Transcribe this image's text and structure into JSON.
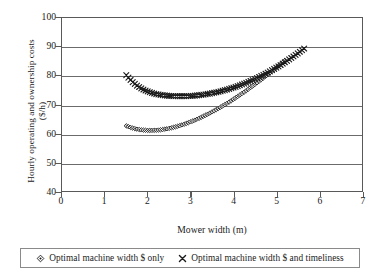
{
  "chart_data": {
    "type": "scatter",
    "title": "",
    "xlabel": "Mower width (m)",
    "ylabel": "Hourly operating and ownership costs",
    "ylabel_line2": "($/h)",
    "xlim": [
      0,
      7
    ],
    "ylim": [
      40,
      100
    ],
    "xticks": [
      0,
      1,
      2,
      3,
      4,
      5,
      6,
      7
    ],
    "yticks": [
      40,
      50,
      60,
      70,
      80,
      90,
      100
    ],
    "grid": "horizontal",
    "legend_position": "below",
    "series": [
      {
        "name": "Optimal machine width $ only",
        "marker": "diamond",
        "x": [
          1.5,
          1.55,
          1.6,
          1.65,
          1.7,
          1.75,
          1.8,
          1.85,
          1.9,
          1.95,
          2.0,
          2.05,
          2.1,
          2.15,
          2.2,
          2.25,
          2.3,
          2.35,
          2.4,
          2.45,
          2.5,
          2.55,
          2.6,
          2.65,
          2.7,
          2.75,
          2.8,
          2.85,
          2.9,
          2.95,
          3.0,
          3.05,
          3.1,
          3.15,
          3.2,
          3.25,
          3.3,
          3.35,
          3.4,
          3.45,
          3.5,
          3.55,
          3.6,
          3.65,
          3.7,
          3.75,
          3.8,
          3.85,
          3.9,
          3.95,
          4.0,
          4.05,
          4.1,
          4.15,
          4.2,
          4.25,
          4.3,
          4.35,
          4.4,
          4.45,
          4.5,
          4.55,
          4.6,
          4.65,
          4.7,
          4.75,
          4.8,
          4.85,
          4.9,
          4.95,
          5.0,
          5.05,
          5.1,
          5.15,
          5.2,
          5.25,
          5.3,
          5.35,
          5.4,
          5.45,
          5.5,
          5.55,
          5.6,
          5.65,
          5.7,
          5.75,
          5.8,
          5.85,
          5.9,
          5.95,
          6.0,
          6.05
        ],
        "y": [
          62.6,
          62.3,
          62.05,
          61.82,
          61.62,
          61.45,
          61.32,
          61.2,
          61.12,
          61.06,
          61.02,
          61.0,
          61.01,
          61.04,
          61.08,
          61.15,
          61.23,
          61.33,
          61.45,
          61.58,
          61.73,
          61.89,
          62.07,
          62.26,
          62.47,
          62.69,
          62.92,
          63.17,
          63.43,
          63.7,
          63.98,
          64.28,
          64.58,
          64.9,
          65.23,
          65.57,
          65.92,
          66.28,
          66.65,
          67.03,
          67.42,
          67.82,
          68.23,
          68.65,
          69.07,
          69.51,
          69.95,
          70.4,
          70.86,
          71.33,
          71.81,
          72.29,
          72.78,
          73.28,
          73.79,
          74.3,
          74.82,
          75.35,
          75.88,
          76.42,
          76.97,
          77.52,
          78.08,
          78.65,
          79.22,
          79.8,
          80.38,
          80.97,
          81.57,
          82.17,
          82.78,
          83.39,
          84.01,
          84.63,
          85.26,
          85.89,
          86.53,
          87.17,
          87.82,
          88.47,
          89.13,
          89.79,
          90.46,
          91.13,
          91.8,
          92.48,
          93.17,
          93.86,
          94.55,
          95.25,
          95.95,
          96.65
        ],
        "y_visible_end": 85.5
      },
      {
        "name": "Optimal machine width $ and timeliness",
        "marker": "cross",
        "x": [
          1.5,
          1.55,
          1.6,
          1.65,
          1.7,
          1.75,
          1.8,
          1.85,
          1.9,
          1.95,
          2.0,
          2.05,
          2.1,
          2.15,
          2.2,
          2.25,
          2.3,
          2.35,
          2.4,
          2.45,
          2.5,
          2.55,
          2.6,
          2.65,
          2.7,
          2.75,
          2.8,
          2.85,
          2.9,
          2.95,
          3.0,
          3.05,
          3.1,
          3.15,
          3.2,
          3.25,
          3.3,
          3.35,
          3.4,
          3.45,
          3.5,
          3.55,
          3.6,
          3.65,
          3.7,
          3.75,
          3.8,
          3.85,
          3.9,
          3.95,
          4.0,
          4.05,
          4.1,
          4.15,
          4.2,
          4.25,
          4.3,
          4.35,
          4.4,
          4.45,
          4.5,
          4.55,
          4.6,
          4.65,
          4.7,
          4.75,
          4.8,
          4.85,
          4.9,
          4.95,
          5.0,
          5.05,
          5.1,
          5.15,
          5.2,
          5.25,
          5.3,
          5.35,
          5.4,
          5.45,
          5.5,
          5.55,
          5.6,
          5.65,
          5.7,
          5.75,
          5.8,
          5.85,
          5.9,
          5.95,
          6.0,
          6.05
        ],
        "y": [
          80.2,
          79.3,
          78.5,
          77.78,
          77.14,
          76.57,
          76.06,
          75.6,
          75.2,
          74.84,
          74.53,
          74.25,
          74.01,
          73.8,
          73.62,
          73.47,
          73.34,
          73.23,
          73.14,
          73.07,
          73.01,
          72.96,
          72.93,
          72.9,
          72.89,
          72.88,
          72.88,
          72.89,
          72.91,
          72.94,
          72.98,
          73.03,
          73.09,
          73.16,
          73.24,
          73.33,
          73.43,
          73.54,
          73.66,
          73.79,
          73.93,
          74.08,
          74.24,
          74.41,
          74.59,
          74.78,
          74.98,
          75.19,
          75.41,
          75.64,
          75.88,
          76.13,
          76.39,
          76.66,
          76.94,
          77.23,
          77.53,
          77.84,
          78.16,
          78.49,
          78.83,
          79.18,
          79.54,
          79.91,
          80.29,
          80.68,
          81.08,
          81.49,
          81.91,
          82.34,
          82.78,
          83.23,
          83.69,
          84.16,
          84.64,
          85.13,
          85.63,
          86.14,
          86.66,
          87.19,
          87.73,
          88.28,
          88.84,
          89.41,
          89.99,
          90.58,
          91.18,
          91.79,
          92.41,
          93.04,
          93.68,
          94.33
        ],
        "y_visible_end": 89.5
      }
    ]
  },
  "axes": {
    "x_tick_labels": [
      "0",
      "1",
      "2",
      "3",
      "4",
      "5",
      "6",
      "7"
    ],
    "y_tick_labels": [
      "40",
      "50",
      "60",
      "70",
      "80",
      "90",
      "100"
    ],
    "x_title": "Mower width (m)",
    "y_title_line1": "Hourly operating and ownership costs",
    "y_title_line2": "($/h)"
  },
  "legend": {
    "entries": [
      {
        "label": "Optimal machine width $ only",
        "marker": "diamond"
      },
      {
        "label": "Optimal machine width $ and timeliness",
        "marker": "cross"
      }
    ]
  },
  "colors": {
    "frame": "#595959",
    "grid": "#6b6b6b",
    "series": "#1a1a1a",
    "background": "#ffffff"
  }
}
